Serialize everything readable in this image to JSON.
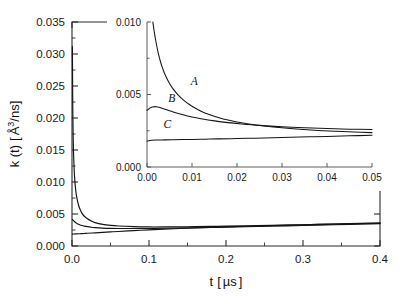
{
  "chart_data": {
    "type": "line",
    "title": "",
    "xlabel": "t [ µs ]",
    "ylabel": "k (t) [ Å³/ns]",
    "xlabel_parts": {
      "symbol": "t",
      "open": "[",
      "unit": "µs",
      "close": "]"
    },
    "ylabel_parts": {
      "symbol": "k (t)",
      "open": "[",
      "unit_base": "Å",
      "unit_sup": "3",
      "unit_rest": "/ns",
      "close": "]"
    },
    "xlim": [
      0.0,
      0.4
    ],
    "ylim": [
      0.0,
      0.035
    ],
    "grid": false,
    "legend": "none",
    "xticks": [
      0.0,
      0.1,
      0.2,
      0.3,
      0.4
    ],
    "xtick_labels": [
      "0.0",
      "0.1",
      "0.2",
      "0.3",
      "0.4"
    ],
    "yticks": [
      0.0,
      0.005,
      0.01,
      0.015,
      0.02,
      0.025,
      0.03,
      0.035
    ],
    "ytick_labels": [
      "0.000",
      "0.005",
      "0.010",
      "0.015",
      "0.020",
      "0.025",
      "0.030",
      "0.035"
    ],
    "series": [
      {
        "name": "A",
        "label": "A",
        "x": [
          0.0005,
          0.001,
          0.0015,
          0.002,
          0.003,
          0.004,
          0.005,
          0.006,
          0.008,
          0.01,
          0.013,
          0.016,
          0.02,
          0.025,
          0.03,
          0.04,
          0.05,
          0.06,
          0.08,
          0.1,
          0.12,
          0.15,
          0.18,
          0.2,
          0.24,
          0.28,
          0.32,
          0.36,
          0.4
        ],
        "y": [
          0.0312,
          0.0216,
          0.0172,
          0.0146,
          0.0115,
          0.0097,
          0.00855,
          0.0077,
          0.0066,
          0.00585,
          0.0051,
          0.00465,
          0.00425,
          0.0039,
          0.00365,
          0.00338,
          0.00322,
          0.00312,
          0.00302,
          0.00298,
          0.00298,
          0.00301,
          0.00306,
          0.0031,
          0.00318,
          0.00327,
          0.00337,
          0.00347,
          0.00358
        ]
      },
      {
        "name": "B",
        "label": "B",
        "x": [
          0.0005,
          0.001,
          0.002,
          0.003,
          0.005,
          0.007,
          0.01,
          0.013,
          0.016,
          0.02,
          0.025,
          0.03,
          0.04,
          0.05,
          0.06,
          0.08,
          0.1,
          0.12,
          0.15,
          0.18,
          0.2,
          0.24,
          0.28,
          0.32,
          0.36,
          0.4
        ],
        "y": [
          0.00415,
          0.00408,
          0.00395,
          0.00383,
          0.00363,
          0.00348,
          0.00332,
          0.0032,
          0.00311,
          0.00302,
          0.00293,
          0.00287,
          0.0028,
          0.00276,
          0.00274,
          0.00273,
          0.00274,
          0.00277,
          0.00283,
          0.0029,
          0.00294,
          0.00304,
          0.00315,
          0.00326,
          0.00338,
          0.0035
        ]
      },
      {
        "name": "C",
        "label": "C",
        "x": [
          0.0005,
          0.002,
          0.005,
          0.01,
          0.016,
          0.02,
          0.03,
          0.04,
          0.05,
          0.06,
          0.08,
          0.1,
          0.12,
          0.15,
          0.18,
          0.2,
          0.24,
          0.28,
          0.32,
          0.36,
          0.4
        ],
        "y": [
          0.00186,
          0.00187,
          0.00189,
          0.00192,
          0.00196,
          0.00199,
          0.00206,
          0.00213,
          0.0022,
          0.00227,
          0.0024,
          0.00252,
          0.00263,
          0.00278,
          0.00291,
          0.00299,
          0.00313,
          0.00326,
          0.00338,
          0.00349,
          0.0036
        ]
      }
    ],
    "inset": {
      "type": "line",
      "xlim": [
        0.0,
        0.05
      ],
      "ylim": [
        0.0,
        0.01
      ],
      "grid": false,
      "xticks": [
        0.0,
        0.01,
        0.02,
        0.03,
        0.04,
        0.05
      ],
      "xtick_labels": [
        "0.00",
        "0.01",
        "0.02",
        "0.03",
        "0.04",
        "0.05"
      ],
      "yticks": [
        0.0,
        0.005,
        0.01
      ],
      "ytick_labels": [
        "0.000",
        "0.005",
        "0.010"
      ],
      "series": [
        {
          "name": "A",
          "label": "A",
          "label_x": 0.0105,
          "label_y": 0.00565,
          "x": [
            0.0013,
            0.0016,
            0.002,
            0.0025,
            0.003,
            0.0035,
            0.004,
            0.005,
            0.006,
            0.007,
            0.008,
            0.009,
            0.01,
            0.012,
            0.014,
            0.016,
            0.018,
            0.02,
            0.023,
            0.026,
            0.03,
            0.034,
            0.038,
            0.042,
            0.046,
            0.05
          ],
          "y": [
            0.01,
            0.00935,
            0.00862,
            0.00785,
            0.00726,
            0.00678,
            0.00638,
            0.00576,
            0.0053,
            0.00494,
            0.00464,
            0.0044,
            0.00419,
            0.00385,
            0.0036,
            0.0034,
            0.00324,
            0.00311,
            0.00295,
            0.00283,
            0.0027,
            0.0026,
            0.00252,
            0.00246,
            0.00241,
            0.00237
          ]
        },
        {
          "name": "B",
          "label": "B",
          "label_x": 0.0055,
          "label_y": 0.00445,
          "x": [
            0.0,
            0.0006,
            0.0012,
            0.002,
            0.003,
            0.004,
            0.005,
            0.006,
            0.008,
            0.01,
            0.012,
            0.015,
            0.018,
            0.021,
            0.025,
            0.03,
            0.035,
            0.04,
            0.045,
            0.05
          ],
          "y": [
            0.0039,
            0.00406,
            0.00414,
            0.00416,
            0.00409,
            0.00399,
            0.00388,
            0.00378,
            0.0036,
            0.00345,
            0.00333,
            0.00318,
            0.00306,
            0.00297,
            0.00287,
            0.00277,
            0.0027,
            0.00265,
            0.00261,
            0.00258
          ]
        },
        {
          "name": "C",
          "label": "C",
          "label_x": 0.0045,
          "label_y": 0.00268,
          "x": [
            0.0,
            0.001,
            0.002,
            0.004,
            0.006,
            0.008,
            0.01,
            0.013,
            0.016,
            0.02,
            0.024,
            0.028,
            0.032,
            0.036,
            0.04,
            0.045,
            0.05
          ],
          "y": [
            0.00178,
            0.00184,
            0.00186,
            0.00187,
            0.00188,
            0.00189,
            0.0019,
            0.00192,
            0.00194,
            0.00196,
            0.00199,
            0.00202,
            0.00205,
            0.00208,
            0.00211,
            0.00215,
            0.00219
          ]
        }
      ]
    },
    "colors": {
      "curve": "#141414",
      "axis": "#2b2b2b",
      "inset_axis": "#4a4a4a",
      "text": "#1a1a1a",
      "background": "#ffffff"
    }
  }
}
